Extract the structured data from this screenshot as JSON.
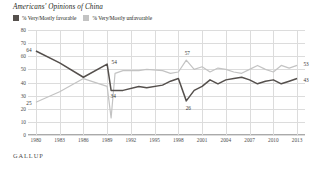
{
  "title": "Americans' Opinions of China",
  "footer": "GALLUP",
  "legend": {
    "position": "top-left",
    "items": [
      {
        "label": "% Very/Mostly favorable",
        "color": "#55504d",
        "name": "legend-favorable"
      },
      {
        "label": "% Very/Mostly unfavorable",
        "color": "#c3c3c3",
        "name": "legend-unfavorable"
      }
    ]
  },
  "chart_data": {
    "type": "line",
    "title": "Americans' Opinions of China",
    "xlabel": "",
    "ylabel": "",
    "ylim": [
      0,
      80
    ],
    "xlim": [
      1979,
      2014
    ],
    "grid": true,
    "yticks": [
      80,
      70,
      60,
      50,
      40,
      30,
      20,
      10,
      0
    ],
    "xticks": [
      1980,
      1983,
      1986,
      1989,
      1992,
      1995,
      1998,
      2001,
      2004,
      2007,
      2010,
      2013
    ],
    "annotations": [
      {
        "text": "64",
        "x": 1980,
        "y": 64,
        "series": "favorable"
      },
      {
        "text": "25",
        "x": 1980,
        "y": 25,
        "series": "unfavorable"
      },
      {
        "text": "54",
        "x": 1989,
        "y": 54,
        "series": "favorable"
      },
      {
        "text": "34",
        "x": 1989,
        "y": 34,
        "series": "favorable"
      },
      {
        "text": "57",
        "x": 1999,
        "y": 57,
        "series": "unfavorable"
      },
      {
        "text": "26",
        "x": 1999,
        "y": 26,
        "series": "favorable"
      },
      {
        "text": "53",
        "x": 2013,
        "y": 53,
        "series": "unfavorable"
      },
      {
        "text": "43",
        "x": 2013,
        "y": 43,
        "series": "favorable"
      }
    ],
    "series": [
      {
        "name": "% Very/Mostly favorable",
        "key": "favorable",
        "color": "#55504d",
        "x": [
          1980,
          1983,
          1986,
          1989,
          1989.5,
          1990,
          1991,
          1993,
          1994,
          1996,
          1997,
          1998,
          1999,
          2000,
          2001,
          2002,
          2003,
          2004,
          2005,
          2006,
          2007,
          2008,
          2009,
          2010,
          2011,
          2012,
          2013
        ],
        "values": [
          64,
          55,
          44,
          54,
          34,
          34,
          34,
          37,
          36,
          38,
          41,
          43,
          26,
          34,
          37,
          42,
          39,
          42,
          43,
          44,
          42,
          39,
          41,
          42,
          39,
          41,
          43
        ]
      },
      {
        "name": "% Very/Mostly unfavorable",
        "key": "unfavorable",
        "color": "#c3c3c3",
        "x": [
          1980,
          1983,
          1986,
          1989,
          1989.5,
          1990,
          1991,
          1993,
          1994,
          1996,
          1997,
          1998,
          1999,
          2000,
          2001,
          2002,
          2003,
          2004,
          2005,
          2006,
          2007,
          2008,
          2009,
          2010,
          2011,
          2012,
          2013
        ],
        "values": [
          25,
          33,
          43,
          37,
          13,
          47,
          49,
          49,
          50,
          49,
          47,
          48,
          57,
          50,
          52,
          48,
          51,
          50,
          48,
          47,
          50,
          53,
          50,
          48,
          53,
          51,
          53
        ]
      }
    ]
  }
}
